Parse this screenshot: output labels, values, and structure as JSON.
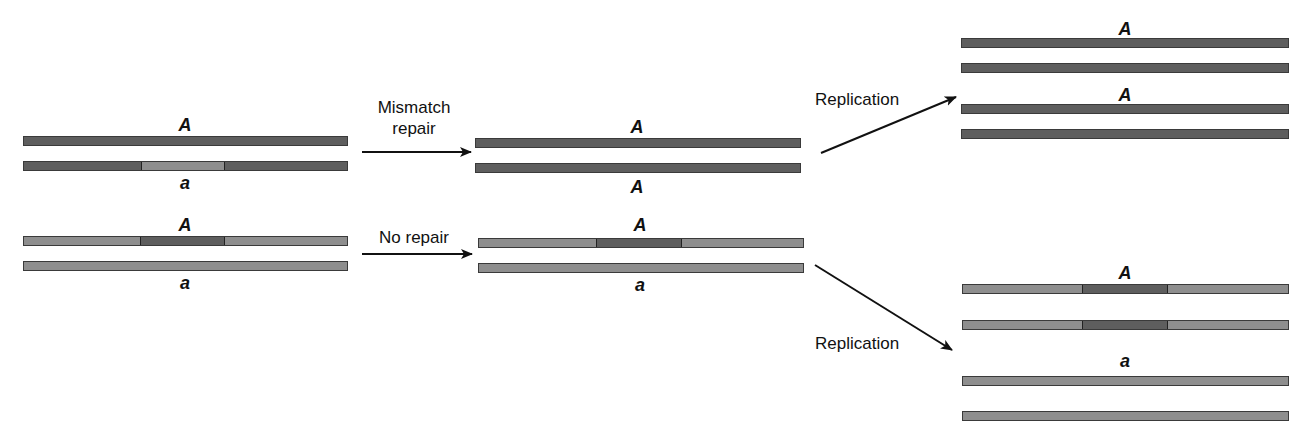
{
  "colors": {
    "dark_strand": "#5e5e5e",
    "light_strand": "#8e8e8e",
    "arrow": "#111111"
  },
  "steps": {
    "mismatch_repair": {
      "line1": "Mismatch",
      "line2": "repair"
    },
    "no_repair": "No repair",
    "replication_top": "Replication",
    "replication_bottom": "Replication"
  },
  "labels": {
    "left_top_upper": "A",
    "left_top_lower": "a",
    "left_bottom_upper": "A",
    "left_bottom_lower": "a",
    "mid_top_upper": "A",
    "mid_top_lower": "A",
    "mid_bottom_upper": "A",
    "mid_bottom_lower": "a",
    "right_top_1": "A",
    "right_top_2": "A",
    "right_bottom_1": "A",
    "right_bottom_2": "a"
  },
  "strands": [
    {
      "id": "left-top-1",
      "x": 23,
      "y": 136,
      "w": 325,
      "base": "dark",
      "segment": null
    },
    {
      "id": "left-top-2",
      "x": 23,
      "y": 161,
      "w": 325,
      "base": "dark",
      "segment": {
        "from": 141,
        "to": 225,
        "color": "light"
      }
    },
    {
      "id": "left-bottom-1",
      "x": 23,
      "y": 236,
      "w": 325,
      "base": "light",
      "segment": {
        "from": 140,
        "to": 225,
        "color": "dark"
      }
    },
    {
      "id": "left-bottom-2",
      "x": 23,
      "y": 261,
      "w": 325,
      "base": "light",
      "segment": null
    },
    {
      "id": "mid-top-1",
      "x": 475,
      "y": 138,
      "w": 326,
      "base": "dark",
      "segment": null
    },
    {
      "id": "mid-top-2",
      "x": 475,
      "y": 163,
      "w": 326,
      "base": "dark",
      "segment": null
    },
    {
      "id": "mid-bottom-1",
      "x": 478,
      "y": 238,
      "w": 326,
      "base": "light",
      "segment": {
        "from": 596,
        "to": 682,
        "color": "dark"
      }
    },
    {
      "id": "mid-bottom-2",
      "x": 478,
      "y": 263,
      "w": 326,
      "base": "light",
      "segment": null
    },
    {
      "id": "right-top-1",
      "x": 961,
      "y": 38,
      "w": 328,
      "base": "dark",
      "segment": null
    },
    {
      "id": "right-top-2",
      "x": 961,
      "y": 63,
      "w": 328,
      "base": "dark",
      "segment": null
    },
    {
      "id": "right-top-3",
      "x": 961,
      "y": 104,
      "w": 328,
      "base": "dark",
      "segment": null
    },
    {
      "id": "right-top-4",
      "x": 961,
      "y": 129,
      "w": 328,
      "base": "dark",
      "segment": null
    },
    {
      "id": "right-bottom-1",
      "x": 962,
      "y": 284,
      "w": 327,
      "base": "light",
      "segment": {
        "from": 1082,
        "to": 1168,
        "color": "dark"
      }
    },
    {
      "id": "right-bottom-2",
      "x": 962,
      "y": 320,
      "w": 327,
      "base": "light",
      "segment": {
        "from": 1082,
        "to": 1168,
        "color": "dark"
      }
    },
    {
      "id": "right-bottom-3",
      "x": 962,
      "y": 376,
      "w": 327,
      "base": "light",
      "segment": null
    },
    {
      "id": "right-bottom-4",
      "x": 962,
      "y": 411,
      "w": 327,
      "base": "light",
      "segment": null
    }
  ]
}
